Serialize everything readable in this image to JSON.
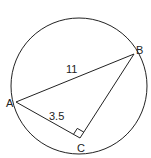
{
  "diagram": {
    "type": "geometry",
    "circle": {
      "cx": 79,
      "cy": 86,
      "r": 68
    },
    "points": {
      "A": {
        "label": "A",
        "x": 16,
        "y": 102
      },
      "B": {
        "label": "B",
        "x": 134,
        "y": 54
      },
      "C": {
        "label": "C",
        "x": 80,
        "y": 138
      }
    },
    "segments": [
      {
        "from": "A",
        "to": "B",
        "label": "11"
      },
      {
        "from": "A",
        "to": "C",
        "label": "3.5"
      },
      {
        "from": "B",
        "to": "C",
        "label": ""
      }
    ],
    "right_angle_at": "C",
    "stroke_color": "#222222",
    "background": "#ffffff"
  }
}
